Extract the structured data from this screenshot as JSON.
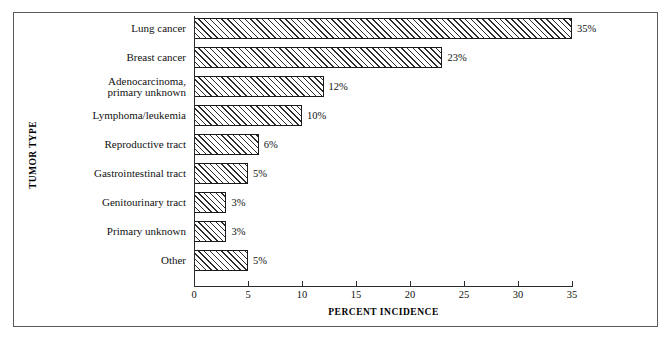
{
  "chart_data": {
    "type": "bar",
    "orientation": "horizontal",
    "title": "",
    "xlabel": "PERCENT INCIDENCE",
    "ylabel": "TUMOR TYPE",
    "categories": [
      "Lung cancer",
      "Breast cancer",
      "Adenocarcinoma,\nprimary unknown",
      "Lymphoma/leukemia",
      "Reproductive tract",
      "Gastrointestinal tract",
      "Genitourinary tract",
      "Primary unknown",
      "Other"
    ],
    "values": [
      35,
      23,
      12,
      10,
      6,
      5,
      3,
      3,
      5
    ],
    "value_labels": [
      "35%",
      "23%",
      "12%",
      "10%",
      "6%",
      "5%",
      "3%",
      "3%",
      "5%"
    ],
    "xlim": [
      0,
      35
    ],
    "xticks": [
      0,
      5,
      10,
      15,
      20,
      25,
      30,
      35
    ],
    "xtick_labels": [
      "0",
      "5",
      "10",
      "15",
      "20",
      "25",
      "30",
      "35"
    ],
    "grid": false,
    "legend": null,
    "bar_fill": "diagonal-hatch",
    "bar_edge_color": "#1a1a1a",
    "background_color": "#ffffff"
  }
}
